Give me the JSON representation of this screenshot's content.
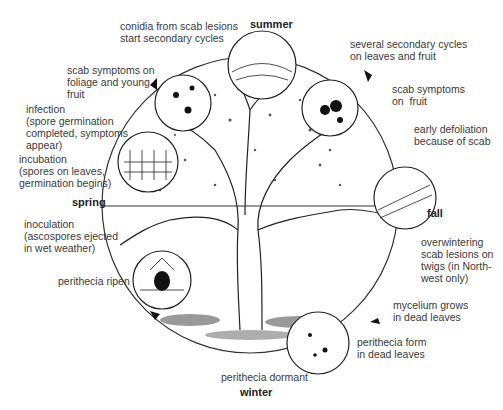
{
  "seasons": {
    "summer": "summer",
    "fall": "fall",
    "winter": "winter",
    "spring": "spring"
  },
  "labels": {
    "conidia": "conidia from scab lesions\nstart secondary cycles",
    "symptoms_foliage": "scab symptoms on\nfoliage and young\nfruit",
    "infection": "infection\n(spore germination\ncompleted, symptoms\nappear)",
    "incubation": "incubation\n(spores on leaves,\ngermination begins)",
    "inoculation": "inoculation\n(ascospores ejected\nin wet weather)",
    "perithecia_ripen": "perithecia ripen",
    "perithecia_dormant": "perithecia dormant",
    "secondary_cycles": "several secondary cycles\non leaves and fruit",
    "symptoms_fruit": "scab symptoms\non  fruit",
    "defoliation": "early defoliation\nbecause of scab",
    "overwintering": "overwintering\nscab lesions on\ntwigs (in North-\nwest only)",
    "mycelium": "mycelium grows\nin dead leaves",
    "perithecia_form": "perithecia form\nin dead leaves"
  }
}
